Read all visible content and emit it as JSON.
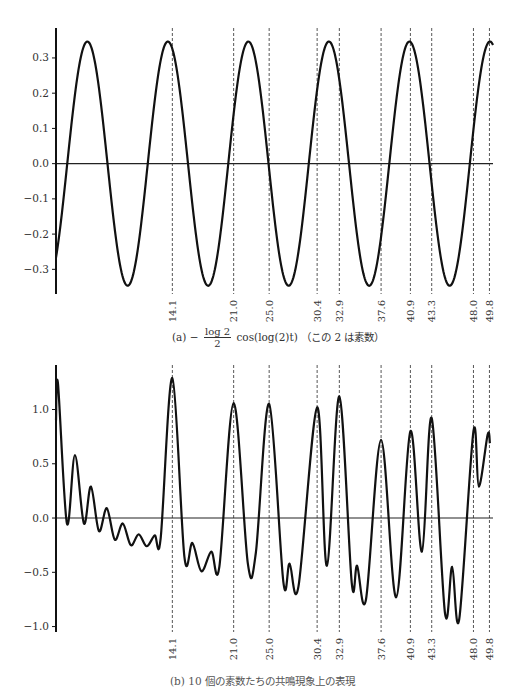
{
  "chart_data": [
    {
      "type": "line",
      "title": "",
      "caption": {
        "label": "(a)",
        "minus": "−",
        "numerator": "log 2",
        "denominator": "2",
        "expr": "cos(log(2)t)",
        "note": "（この 2 は素数）"
      },
      "xlabel": "",
      "ylabel": "",
      "xlim": [
        1,
        50.2
      ],
      "ylim": [
        -0.37,
        0.385
      ],
      "yticks": [
        0.3,
        0.2,
        0.1,
        0.0,
        -0.1,
        -0.2,
        -0.3
      ],
      "ytick_labels": [
        "0.3",
        "0.2",
        "0.1",
        "0.0",
        "−0.1",
        "−0.2",
        "−0.3"
      ],
      "vlines": [
        14.1,
        21.0,
        25.0,
        30.4,
        32.9,
        37.6,
        40.9,
        43.3,
        48.0,
        49.8
      ],
      "xtick_labels": [
        "14.1",
        "21.0",
        "25.0",
        "30.4",
        "32.9",
        "37.6",
        "40.9",
        "43.3",
        "48.0",
        "49.8"
      ],
      "series": [
        {
          "name": "-(log 2 / 2) cos(log(2) t)",
          "formula": {
            "amplitude": 0.34657,
            "omega": 0.693147
          }
        }
      ],
      "grid": false,
      "zero_line": true
    },
    {
      "type": "line",
      "title": "",
      "caption": {
        "text": "(b) 10 個の素数たちの共鳴現象上の表現"
      },
      "xlabel": "",
      "ylabel": "",
      "xlim": [
        1,
        50.2
      ],
      "ylim": [
        -1.05,
        1.41
      ],
      "yticks": [
        1.0,
        0.5,
        0.0,
        -0.5,
        -1.0
      ],
      "ytick_labels": [
        "1.0",
        "0.5",
        "0.0",
        "−0.5",
        "−1.0"
      ],
      "vlines": [
        14.1,
        21.0,
        25.0,
        30.4,
        32.9,
        37.6,
        40.9,
        43.3,
        48.0,
        49.8
      ],
      "xtick_labels": [
        "14.1",
        "21.0",
        "25.0",
        "30.4",
        "32.9",
        "37.6",
        "40.9",
        "43.3",
        "48.0",
        "49.8"
      ],
      "series": [
        {
          "name": "sum over 10 primes",
          "points": [
            [
              1.0,
              0.9
            ],
            [
              1.22,
              1.24
            ],
            [
              2.23,
              -0.05
            ],
            [
              3.13,
              0.58
            ],
            [
              4.14,
              -0.05
            ],
            [
              4.93,
              0.29
            ],
            [
              5.83,
              -0.12
            ],
            [
              6.72,
              0.09
            ],
            [
              7.62,
              -0.2
            ],
            [
              8.52,
              -0.05
            ],
            [
              9.42,
              -0.25
            ],
            [
              10.31,
              -0.15
            ],
            [
              11.21,
              -0.26
            ],
            [
              12.11,
              -0.16
            ],
            [
              12.78,
              -0.19
            ],
            [
              14.1,
              1.29
            ],
            [
              15.46,
              -0.36
            ],
            [
              16.36,
              -0.23
            ],
            [
              17.37,
              -0.49
            ],
            [
              18.49,
              -0.31
            ],
            [
              19.39,
              -0.45
            ],
            [
              21.0,
              1.06
            ],
            [
              22.6,
              -0.42
            ],
            [
              23.5,
              -0.32
            ],
            [
              25.0,
              1.05
            ],
            [
              26.6,
              -0.59
            ],
            [
              27.3,
              -0.42
            ],
            [
              28.3,
              -0.63
            ],
            [
              30.4,
              1.02
            ],
            [
              31.5,
              -0.44
            ],
            [
              32.9,
              1.12
            ],
            [
              34.3,
              -0.6
            ],
            [
              34.9,
              -0.44
            ],
            [
              35.9,
              -0.75
            ],
            [
              37.6,
              0.72
            ],
            [
              39.3,
              -0.73
            ],
            [
              40.9,
              0.8
            ],
            [
              42.2,
              -0.31
            ],
            [
              43.3,
              0.92
            ],
            [
              44.8,
              -0.88
            ],
            [
              45.6,
              -0.45
            ],
            [
              46.4,
              -0.93
            ],
            [
              48.0,
              0.8
            ],
            [
              48.6,
              0.29
            ],
            [
              49.6,
              0.77
            ],
            [
              49.85,
              0.69
            ]
          ]
        }
      ],
      "grid": false,
      "zero_line": true
    }
  ]
}
